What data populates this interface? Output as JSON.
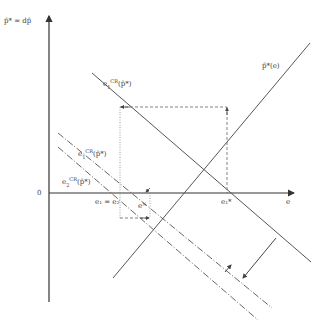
{
  "diagram": {
    "type": "economic-diagram",
    "axes": {
      "y_label": "p̂* = dp̂",
      "x_label": "e",
      "origin_label": "0"
    },
    "curves": [
      {
        "id": "p-star-e",
        "label": "p̂*(e)",
        "style": "solid"
      },
      {
        "id": "e1-cr-upper",
        "label": "e₁^CR(p̂*)",
        "style": "solid"
      },
      {
        "id": "e1-cr-lower",
        "label": "e₁^CR(p̂*)",
        "style": "dash-dot"
      },
      {
        "id": "e2-cr",
        "label": "e₂^CR(p̂*)",
        "style": "dash-dot"
      }
    ],
    "labels": {
      "p_star_e": "p̂*(e)",
      "e1_cr_upper_base": "e",
      "e1_cr_upper_sup": "CR",
      "e1_cr_upper_sub": "1",
      "e1_cr_upper_arg": "(p̂*)",
      "e1_cr_lower_base": "e",
      "e1_cr_lower_sup": "CR",
      "e1_cr_lower_sub": "1",
      "e1_cr_lower_arg": "(p̂*)",
      "e2_cr_base": "e",
      "e2_cr_sup": "CR",
      "e2_cr_sub": "2",
      "e2_cr_arg": "(p̂*)",
      "e1_eq_e2": "e₁ = e₂",
      "e1_star": "e₁*",
      "e_n": "eᴺ"
    },
    "colors": {
      "line": "#555555",
      "axis": "#333333",
      "text": "#444444"
    }
  }
}
